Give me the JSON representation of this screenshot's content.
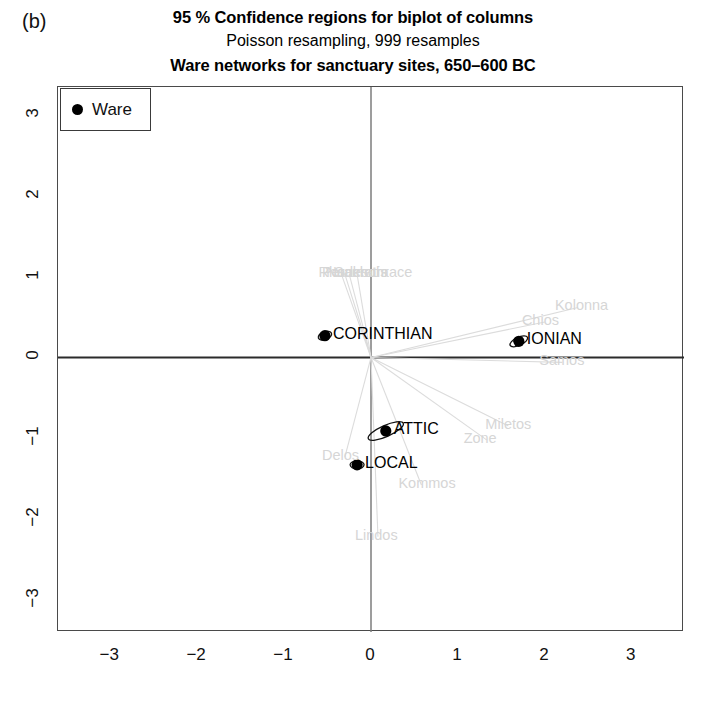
{
  "panel": {
    "tag": "(b)"
  },
  "titles": {
    "line1": "95 % Confidence regions for biplot of columns",
    "line2": "Poisson resampling, 999 resamples",
    "line3": "Ware networks for sanctuary sites, 650–600 BC"
  },
  "legend": {
    "entry_label": "Ware",
    "marker": "filled-circle",
    "marker_color": "#000000"
  },
  "chart_data": {
    "type": "scatter",
    "title": "95 % Confidence regions for biplot of columns",
    "subtitle": "Poisson resampling, 999 resamples",
    "subtitle2": "Ware networks for sanctuary sites, 650–600 BC",
    "xlabel": "",
    "ylabel": "",
    "xlim": [
      -3.6,
      3.6
    ],
    "ylim": [
      -3.4,
      3.35
    ],
    "xticks": [
      -3,
      -2,
      -1,
      0,
      1,
      2,
      3
    ],
    "yticks": [
      -3,
      -2,
      -1,
      0,
      1,
      2,
      3
    ],
    "grid": false,
    "legend_position": "top-left",
    "series": [
      {
        "name": "Ware",
        "marker": "filled-circle",
        "color": "#000000",
        "points": [
          {
            "label": "CORINTHIAN",
            "x": -0.53,
            "y": 0.27,
            "ellipse": {
              "rx": 0.07,
              "ry": 0.04,
              "angle": -20
            }
          },
          {
            "label": "IONIAN",
            "x": 1.7,
            "y": 0.2,
            "ellipse": {
              "rx": 0.11,
              "ry": 0.05,
              "angle": -25
            }
          },
          {
            "label": "ATTIC",
            "x": 0.17,
            "y": -0.91,
            "ellipse": {
              "rx": 0.22,
              "ry": 0.07,
              "angle": -24
            }
          },
          {
            "label": "LOCAL",
            "x": -0.16,
            "y": -1.33,
            "ellipse": {
              "rx": 0.05,
              "ry": 0.04,
              "angle": 0
            }
          }
        ]
      },
      {
        "name": "Sites",
        "marker": "none",
        "color": "#d6d6d6",
        "points": [
          {
            "label": "Perachora",
            "x": -0.3,
            "y": 1.03
          },
          {
            "label": "Rhodes",
            "x": -0.34,
            "y": 1.03
          },
          {
            "label": "Naukratis",
            "x": -0.25,
            "y": 1.03
          },
          {
            "label": "Samothrace",
            "x": -0.16,
            "y": 1.03
          },
          {
            "label": "Kolonna",
            "x": 2.38,
            "y": 0.62
          },
          {
            "label": "Chios",
            "x": 2.0,
            "y": 0.44
          },
          {
            "label": "Samos",
            "x": 2.2,
            "y": -0.06
          },
          {
            "label": "Miletos",
            "x": 1.58,
            "y": -0.85
          },
          {
            "label": "Zone",
            "x": 1.33,
            "y": -1.02
          },
          {
            "label": "Delos",
            "x": -0.3,
            "y": -1.23
          },
          {
            "label": "Kommos",
            "x": 0.58,
            "y": -1.58
          },
          {
            "label": "Lindos",
            "x": 0.08,
            "y": -2.22
          }
        ]
      }
    ]
  }
}
